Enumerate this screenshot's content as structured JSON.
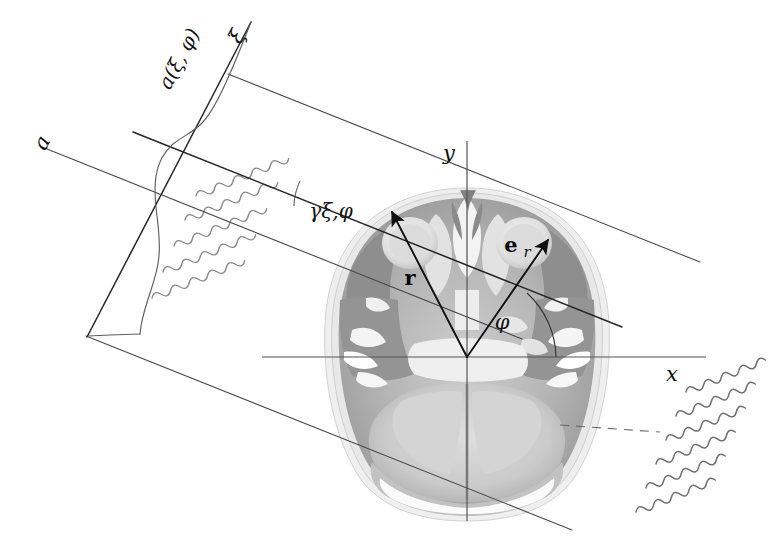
{
  "figure": {
    "domain": "Diagram",
    "background_color": "#ffffff"
  },
  "colors": {
    "line": "#4a4a4a",
    "line_dark": "#262626",
    "axis": "#555555",
    "wave": "#8a8a8a",
    "vector": "#111111",
    "label": "#111111",
    "tissue_dark": "#8e8e8e",
    "tissue_mid": "#b4b4b4",
    "tissue_light": "#d6d6d6"
  },
  "labels": {
    "x_axis": "x",
    "y_axis": "y",
    "xi_axis": "ξ",
    "a_axis": "a",
    "projection_function": "a(ξ, φ)",
    "ray_label": "γξ,φ",
    "radius_vector": "r",
    "unit_vector_base": "e",
    "unit_vector_sub": "r",
    "angle_phi": "φ"
  },
  "geometry": {
    "origin": {
      "x": 467,
      "y": 357
    },
    "x_axis": {
      "x1": 262,
      "y1": 357,
      "x2": 706,
      "y2": 357
    },
    "y_axis": {
      "x1": 467,
      "y1": 141,
      "x2": 467,
      "y2": 521
    },
    "beam_angle_deg": -22,
    "phi_deg": 47,
    "beam_lines": [
      {
        "name": "beam-top",
        "x1": 225,
        "y1": 73,
        "x2": 700,
        "y2": 262
      },
      {
        "name": "beam-middle",
        "x1": 131,
        "y1": 132,
        "x2": 620,
        "y2": 327
      },
      {
        "name": "beam-bottom",
        "x1": 85,
        "y1": 335,
        "x2": 570,
        "y2": 530
      }
    ],
    "xi_axis_line": {
      "x1": 249,
      "y1": 24,
      "x2": 86,
      "y2": 336
    },
    "a_axis_line": {
      "x1": 43,
      "y1": 148,
      "x2": 520,
      "y2": 338
    },
    "gamma_ray_line": {
      "x1": 225,
      "y1": 73,
      "x2": 700,
      "y2": 262
    },
    "r_vector": {
      "x1": 467,
      "y1": 357,
      "x2": 396,
      "y2": 213
    },
    "er_vector": {
      "x1": 467,
      "y1": 357,
      "x2": 545,
      "y2": 243
    },
    "phi_arc_radius": 72
  },
  "waves": {
    "left_group": {
      "count": 5,
      "label": "x-ray-waves-left",
      "origin_x": 178,
      "origin_y": 196,
      "length": 108,
      "amplitude": 7,
      "period": 20,
      "row_spacing": 26,
      "tilt_deg": -22
    },
    "right_group": {
      "count": 6,
      "label": "x-ray-waves-right",
      "origin_x": 668,
      "origin_y": 392,
      "length": 104,
      "amplitude": 7,
      "period": 19,
      "row_spacing": 25,
      "tilt_deg": -22
    }
  },
  "profile": {
    "name": "projection-profile-curve",
    "description": "attenuation profile a(xi, phi) plotted along the xi axis",
    "points": [
      [
        249,
        24
      ],
      [
        237,
        49
      ],
      [
        224,
        78
      ],
      [
        213,
        100
      ],
      [
        205,
        116
      ],
      [
        196,
        127
      ],
      [
        186,
        134
      ],
      [
        175,
        141
      ],
      [
        166,
        152
      ],
      [
        160,
        168
      ],
      [
        157,
        186
      ],
      [
        156,
        206
      ],
      [
        158,
        228
      ],
      [
        159,
        248
      ],
      [
        157,
        266
      ],
      [
        152,
        282
      ],
      [
        147,
        297
      ],
      [
        143,
        312
      ],
      [
        141,
        324
      ],
      [
        139,
        332
      ],
      [
        120,
        334
      ],
      [
        100,
        335
      ],
      [
        86,
        336
      ]
    ]
  }
}
